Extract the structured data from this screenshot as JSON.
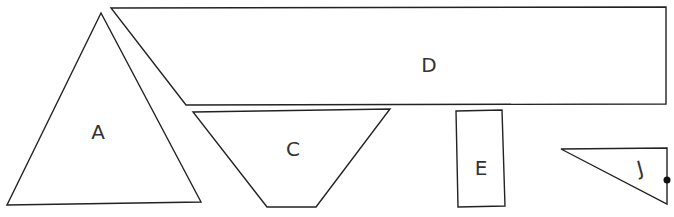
{
  "diagram": {
    "stroke_color": "#222222",
    "background": "#ffffff",
    "shapes": [
      {
        "id": "A",
        "label": "A",
        "type": "triangle",
        "points": "101,13 7,205 201,202",
        "label_pos": [
          98,
          132
        ]
      },
      {
        "id": "D",
        "label": "D",
        "type": "trapezoid",
        "points": "111,8 666,7 666,104 186,105",
        "label_pos": [
          429,
          72
        ]
      },
      {
        "id": "C",
        "label": "C",
        "type": "trapezoid",
        "points": "193,112 390,109 316,207 267,207",
        "label_pos": [
          293,
          156
        ]
      },
      {
        "id": "E",
        "label": "E",
        "type": "rectangle",
        "points": "456,111 502,110 505,206 458,207",
        "label_pos": [
          481,
          168
        ]
      },
      {
        "id": "J",
        "label": "J",
        "type": "triangle",
        "points": "561,149 667,148 667,204",
        "label_pos": [
          640,
          168
        ],
        "label_rotation": -15
      }
    ],
    "marker": {
      "label": "",
      "cx": 667,
      "cy": 180,
      "r": 3.5
    }
  }
}
